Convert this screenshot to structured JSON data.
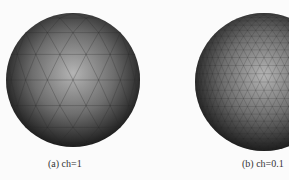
{
  "figure": {
    "panels": [
      {
        "id": "a",
        "caption": "(a) ch=1",
        "mesh": "coarse",
        "cx": 73,
        "cy": 80,
        "r": 67,
        "divisions": 8
      },
      {
        "id": "b",
        "caption": "(b) ch=0.1",
        "mesh": "fine",
        "cx": 119,
        "cy": 82,
        "r": 69,
        "divisions": 26
      }
    ],
    "colors": {
      "background": "#fbfbfb",
      "sphere_highlight": "#b4b4b4",
      "sphere_mid": "#6e6e6e",
      "sphere_edge": "#1c1c1c",
      "mesh_line": "#2a2a2a"
    }
  }
}
